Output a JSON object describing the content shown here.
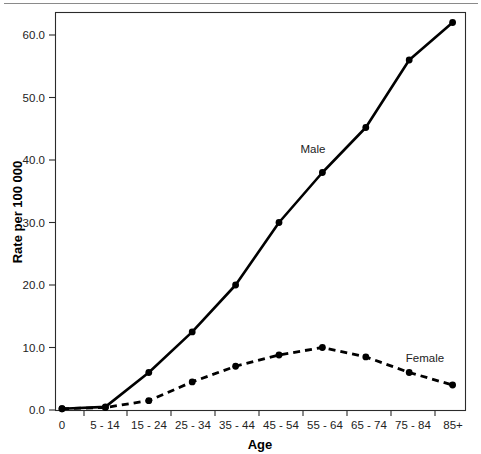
{
  "figure": {
    "background_color": "#ffffff",
    "line_color": "#000000",
    "frame_color": "#2b2b2b",
    "top_rule_color": "#8a8a8a"
  },
  "labels": {
    "male": "Male",
    "female": "Female",
    "xlabel": "Age",
    "ylabel": "Rate per 100 000",
    "origin_tick": "0"
  },
  "chart_data": {
    "type": "line",
    "title": "",
    "xlabel": "Age",
    "ylabel": "Rate per 100 000",
    "categories": [
      "0",
      "5 - 14",
      "15 - 24",
      "25 - 34",
      "35 - 44",
      "45 - 54",
      "55 - 64",
      "65 - 74",
      "75 - 84",
      "85+"
    ],
    "xtick_labels": [
      "0",
      "5 - 14",
      "15 - 24",
      "25 - 34",
      "35 - 44",
      "45 - 54",
      "55 - 64",
      "65 - 74",
      "75 - 84",
      "85+"
    ],
    "ytick_labels": [
      "0.0",
      "10.0",
      "20.0",
      "30.0",
      "40.0",
      "50.0",
      "60.0"
    ],
    "ytick_values": [
      0,
      10,
      20,
      30,
      40,
      50,
      60
    ],
    "ylim": [
      0,
      63.5
    ],
    "grid": false,
    "legend_position": "inline-annotation",
    "series": [
      {
        "name": "Male",
        "style": "solid",
        "marker": "circle",
        "values": [
          0.2,
          0.5,
          6.0,
          12.5,
          20.0,
          30.0,
          38.0,
          45.2,
          56.0,
          62.0
        ]
      },
      {
        "name": "Female",
        "style": "dashed",
        "marker": "circle",
        "values": [
          0.2,
          0.4,
          1.5,
          4.5,
          7.0,
          8.8,
          10.0,
          8.5,
          6.0,
          4.0
        ]
      }
    ],
    "annotations": [
      {
        "text": "Male",
        "x_category": "45 - 54",
        "y_value": 42.5
      },
      {
        "text": "Female",
        "x_category": "75 - 84",
        "y_value": 9.9
      }
    ]
  }
}
